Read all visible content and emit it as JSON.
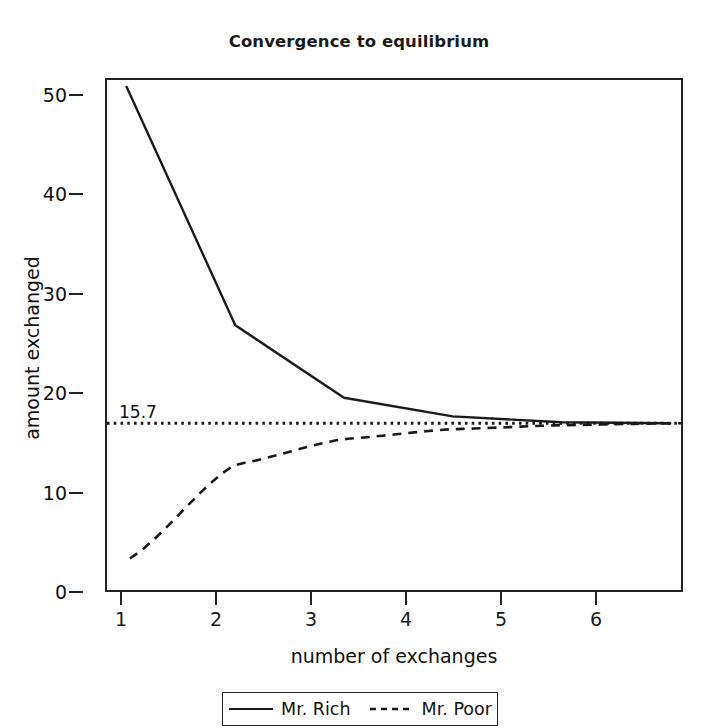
{
  "chart_data": {
    "type": "line",
    "title": "Convergence to equilibrium",
    "xlabel": "number of exchanges",
    "ylabel": "amount exchanged",
    "x": [
      1,
      2,
      3,
      4,
      5,
      6
    ],
    "xlim": [
      0.82,
      6.1
    ],
    "ylim": [
      -1.3,
      50.7
    ],
    "xticks": [
      "1",
      "2",
      "3",
      "4",
      "5",
      "6"
    ],
    "yticks": [
      "0",
      "10",
      "20",
      "30",
      "40",
      "50"
    ],
    "grid": false,
    "legend_position": "below-axes",
    "series": [
      {
        "name": "Mr. Rich",
        "style": "solid",
        "color": "#1a1a1a",
        "values": [
          50.0,
          25.7,
          18.3,
          16.4,
          15.8,
          15.7
        ]
      },
      {
        "name": "Mr. Poor",
        "style": "dashed",
        "color": "#1a1a1a",
        "values": [
          1.7,
          11.5,
          14.1,
          15.1,
          15.5,
          15.7
        ]
      }
    ],
    "annotations": [
      {
        "name": "equilibrium-line",
        "label": "15.7",
        "value": 15.7,
        "style": "dotted",
        "color": "#1a1a1a"
      }
    ]
  },
  "legend": {
    "entries": [
      {
        "label": "Mr. Rich",
        "style": "solid"
      },
      {
        "label": "Mr. Poor",
        "style": "dashed"
      }
    ]
  }
}
